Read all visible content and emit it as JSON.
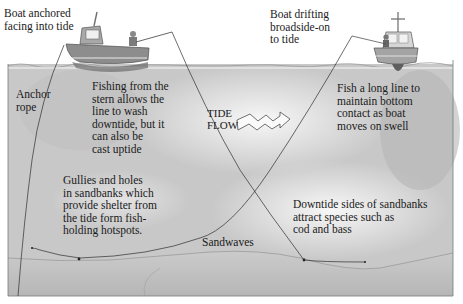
{
  "diagram": {
    "labels": {
      "boat_anchored": "Boat anchored\nfacing into tide",
      "boat_drifting": "Boat drifting\nbroadside-on\nto tide",
      "anchor_rope": "Anchor\nrope",
      "fishing_stern": "Fishing from the\nstern allows the\nline to wash\ndowntide, but it\ncan also be\ncast uptide",
      "tide_flow": "TIDE\nFLOW",
      "long_line": "Fish a long line to\nmaintain bottom\ncontact as boat\nmoves on swell",
      "gullies": "Gullies and holes\nin sandbanks which\nprovide shelter from\nthe tide form fish-\nholding hotspots.",
      "downtide": "Downtide sides of sandbanks\nattract species such as\ncod and bass",
      "sandwaves": "Sandwaves"
    },
    "colors": {
      "water": "#c9c9c9",
      "water_light": "#ececec",
      "seabed": "#bdbdbd",
      "boat_hull": "#8f8f8f",
      "line": "#2a2a2a"
    }
  }
}
